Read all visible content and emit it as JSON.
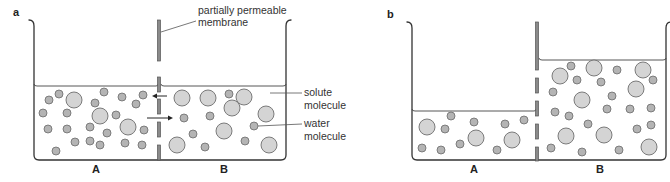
{
  "figure": {
    "panels": [
      {
        "id": "a",
        "letter": "a",
        "letter_pos": [
          13,
          16
        ],
        "beaker": {
          "left": 34,
          "right": 286,
          "top": 22,
          "bottom": 160
        },
        "membrane_x": 159,
        "membrane_segments": [
          [
            20,
            61
          ],
          [
            77,
            92
          ],
          [
            99,
            114
          ],
          [
            122,
            137
          ],
          [
            145,
            160
          ]
        ],
        "water_level_left": 86,
        "water_level_right": 86,
        "compartments": [
          {
            "label": "A",
            "label_pos": [
              96,
              173
            ]
          },
          {
            "label": "B",
            "label_pos": [
              224,
              173
            ]
          }
        ],
        "arrows": [
          {
            "direction": "left",
            "from": [
              167,
              96
            ],
            "to": [
              152,
              96
            ]
          },
          {
            "direction": "right",
            "from": [
              147,
              118
            ],
            "to": [
              173,
              118
            ]
          }
        ],
        "solute_molecules": [
          [
            74,
            100
          ],
          [
            100,
            116
          ],
          [
            128,
            127
          ],
          [
            182,
            98
          ],
          [
            208,
            98
          ],
          [
            244,
            97
          ],
          [
            232,
            108
          ],
          [
            266,
            114
          ],
          [
            224,
            131
          ],
          [
            269,
            145
          ],
          [
            177,
            145
          ]
        ],
        "water_molecules": [
          [
            59,
            94
          ],
          [
            49,
            100
          ],
          [
            43,
            113
          ],
          [
            67,
            113
          ],
          [
            48,
            129
          ],
          [
            67,
            129
          ],
          [
            56,
            151
          ],
          [
            75,
            142
          ],
          [
            90,
            141
          ],
          [
            104,
            92
          ],
          [
            122,
            97
          ],
          [
            143,
            95
          ],
          [
            95,
            103
          ],
          [
            116,
            115
          ],
          [
            136,
            104
          ],
          [
            90,
            127
          ],
          [
            107,
            133
          ],
          [
            144,
            130
          ],
          [
            100,
            145
          ],
          [
            125,
            143
          ],
          [
            142,
            145
          ],
          [
            229,
            94
          ],
          [
            184,
            118
          ],
          [
            210,
            116
          ],
          [
            193,
            134
          ],
          [
            254,
            126
          ],
          [
            245,
            141
          ],
          [
            205,
            147
          ]
        ],
        "callouts": [
          {
            "id": "membrane",
            "lines": [
              "partially permeable",
              "membrane"
            ],
            "text_pos": [
              198,
              14
            ],
            "line_height": 12,
            "leader": [
              [
                161,
                32
              ],
              [
                196,
                21
              ]
            ]
          },
          {
            "id": "solute",
            "lines": [
              "solute",
              "molecule"
            ],
            "text_pos": [
              304,
              96
            ],
            "line_height": 13,
            "leader": [
              [
                270,
                93
              ],
              [
                302,
                93
              ]
            ]
          },
          {
            "id": "water",
            "lines": [
              "water",
              "molecule"
            ],
            "text_pos": [
              304,
              127
            ],
            "line_height": 13,
            "leader": [
              [
                258,
                126
              ],
              [
                302,
                124
              ]
            ]
          }
        ]
      },
      {
        "id": "b",
        "letter": "b",
        "letter_pos": [
          387,
          18
        ],
        "beaker": {
          "left": 412,
          "right": 666,
          "top": 24,
          "bottom": 160
        },
        "membrane_x": 537,
        "membrane_segments": [
          [
            22,
            70
          ],
          [
            78,
            93
          ],
          [
            101,
            116
          ],
          [
            124,
            139
          ],
          [
            147,
            161
          ]
        ],
        "water_level_left": 111,
        "water_level_right": 60,
        "compartments": [
          {
            "label": "A",
            "label_pos": [
              474,
              173
            ]
          },
          {
            "label": "B",
            "label_pos": [
              600,
              173
            ]
          }
        ],
        "arrows": [],
        "solute_molecules": [
          [
            427,
            127
          ],
          [
            476,
            138
          ],
          [
            512,
            140
          ],
          [
            560,
            76
          ],
          [
            594,
            68
          ],
          [
            582,
            100
          ],
          [
            643,
            70
          ],
          [
            636,
            89
          ],
          [
            566,
            136
          ],
          [
            604,
            135
          ],
          [
            649,
            147
          ]
        ],
        "water_molecules": [
          [
            451,
            116
          ],
          [
            445,
            129
          ],
          [
            474,
            122
          ],
          [
            505,
            124
          ],
          [
            524,
            120
          ],
          [
            422,
            148
          ],
          [
            441,
            150
          ],
          [
            460,
            144
          ],
          [
            497,
            150
          ],
          [
            571,
            66
          ],
          [
            577,
            80
          ],
          [
            601,
            82
          ],
          [
            617,
            70
          ],
          [
            653,
            80
          ],
          [
            553,
            92
          ],
          [
            612,
            96
          ],
          [
            555,
            112
          ],
          [
            569,
            116
          ],
          [
            607,
            109
          ],
          [
            630,
            109
          ],
          [
            651,
            108
          ],
          [
            588,
            124
          ],
          [
            637,
            129
          ],
          [
            651,
            125
          ],
          [
            551,
            148
          ],
          [
            582,
            152
          ],
          [
            619,
            150
          ]
        ]
      }
    ],
    "sizes": {
      "solute_radius": 8,
      "water_radius": 4
    },
    "colors": {
      "outline": "#333333",
      "membrane": "#8a8a8a",
      "solute_fill": "#d4d4d4",
      "water_fill": "#b4b4b4",
      "text": "#222222"
    }
  }
}
